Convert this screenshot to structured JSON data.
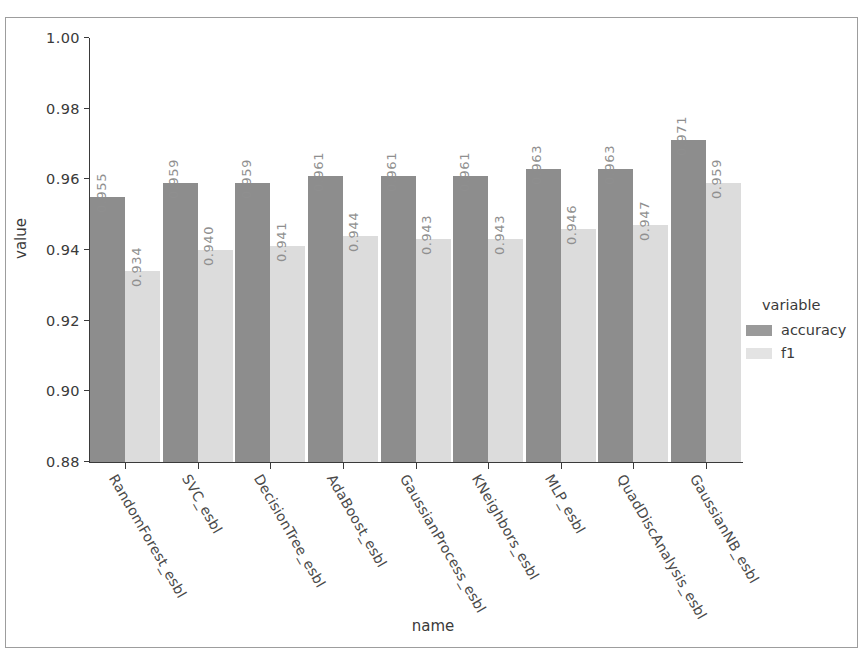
{
  "chart_data": {
    "type": "bar",
    "title": "",
    "xlabel": "name",
    "ylabel": "value",
    "ylim": [
      0.88,
      1.0
    ],
    "yticks": [
      "0.88",
      "0.90",
      "0.92",
      "0.94",
      "0.96",
      "0.98",
      "1.00"
    ],
    "ytick_values": [
      0.88,
      0.9,
      0.92,
      0.94,
      0.96,
      0.98,
      1.0
    ],
    "grid": false,
    "legend_title": "variable",
    "legend_position": "right",
    "categories": [
      "RandomForest_esbl",
      "SVC_esbl",
      "DecisionTree_esbl",
      "AdaBoost_esbl",
      "GaussianProcess_esbl",
      "KNeighbors_esbl",
      "MLP_esbl",
      "QuadDiscAnalysis_esbl",
      "GaussianNB_esbl"
    ],
    "series": [
      {
        "name": "accuracy",
        "color": "#8d8d8d",
        "values": [
          0.955,
          0.959,
          0.959,
          0.961,
          0.961,
          0.961,
          0.963,
          0.963,
          0.971
        ],
        "labels": [
          "0.955",
          "0.959",
          "0.959",
          "0.961",
          "0.961",
          "0.961",
          "0.963",
          "0.963",
          "0.971"
        ]
      },
      {
        "name": "f1",
        "color": "#dcdcdc",
        "values": [
          0.934,
          0.94,
          0.941,
          0.944,
          0.943,
          0.943,
          0.946,
          0.947,
          0.959
        ],
        "labels": [
          "0.934",
          "0.940",
          "0.941",
          "0.944",
          "0.943",
          "0.943",
          "0.946",
          "0.947",
          "0.959"
        ]
      }
    ]
  },
  "legend": {
    "title": "variable",
    "entries": [
      {
        "label": "accuracy",
        "color": "#9a9a9a"
      },
      {
        "label": "f1",
        "color": "#e3e3e3"
      }
    ]
  },
  "axes": {
    "x_title": "name",
    "y_title": "value"
  }
}
